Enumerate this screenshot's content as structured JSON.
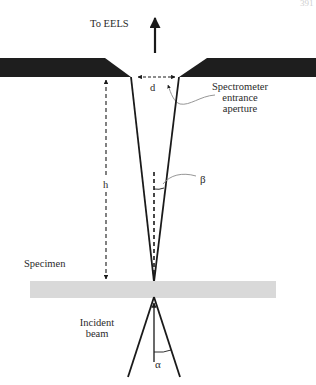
{
  "figure": {
    "page_number": "391",
    "labels": {
      "to_eels": "To EELS",
      "d": "d",
      "aperture_line1": "Spectrometer",
      "aperture_line2": "entrance",
      "aperture_line3": "aperture",
      "h": "h",
      "beta": "β",
      "specimen": "Specimen",
      "incident_line1": "Incident",
      "incident_line2": "beam",
      "alpha": "α"
    },
    "colors": {
      "aperture_plate": "#1e1e1e",
      "specimen": "#d9d9d9",
      "lines": "#1a1a1a",
      "leader": "#8a8a8a"
    }
  }
}
